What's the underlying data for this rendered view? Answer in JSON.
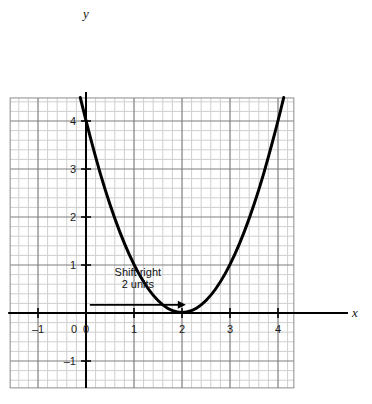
{
  "chart_data": {
    "type": "line",
    "title": "",
    "subtitle": "",
    "xlabel": "x",
    "ylabel": "y",
    "xlim": [
      -1.58,
      4.33
    ],
    "ylim": [
      -1.56,
      4.48
    ],
    "grid": true,
    "minor_grid": true,
    "minor_step": 0.2,
    "major_step": 1,
    "legend": "none",
    "xticks": [
      -1,
      0,
      1,
      2,
      3,
      4
    ],
    "xtick_labels": [
      "–1",
      "0",
      "1",
      "2",
      "3",
      "4"
    ],
    "yticks": [
      -1,
      1,
      2,
      3,
      4
    ],
    "ytick_labels": [
      "–1",
      "1",
      "2",
      "3",
      "4"
    ],
    "origin_label": "0",
    "series": [
      {
        "name": "y = (x - 2)^2",
        "equation": "y = (x – 2)²",
        "vertex": [
          2,
          0
        ],
        "color": "#000000",
        "width": 3,
        "points": [
          [
            -0.12,
            4.49
          ],
          [
            0.0,
            4.0
          ],
          [
            0.2,
            3.24
          ],
          [
            0.4,
            2.56
          ],
          [
            0.6,
            1.96
          ],
          [
            0.8,
            1.44
          ],
          [
            1.0,
            1.0
          ],
          [
            1.2,
            0.64
          ],
          [
            1.4,
            0.36
          ],
          [
            1.6,
            0.16
          ],
          [
            1.8,
            0.04
          ],
          [
            2.0,
            0.0
          ],
          [
            2.2,
            0.04
          ],
          [
            2.4,
            0.16
          ],
          [
            2.6,
            0.36
          ],
          [
            2.8,
            0.64
          ],
          [
            3.0,
            1.0
          ],
          [
            3.2,
            1.44
          ],
          [
            3.4,
            1.96
          ],
          [
            3.6,
            2.56
          ],
          [
            3.8,
            3.24
          ],
          [
            4.0,
            4.0
          ],
          [
            4.12,
            4.49
          ]
        ]
      }
    ],
    "annotations": [
      {
        "name": "shift-right-annotation",
        "line1": "Shift right",
        "line2": "2 units",
        "text_x": 1.08,
        "text_y1": 0.78,
        "text_y2": 0.52,
        "arrow_from": [
          0.08,
          0.17
        ],
        "arrow_to": [
          2.08,
          0.17
        ],
        "arrow_color": "#000000"
      }
    ],
    "colors": {
      "curve": "#000000",
      "axis": "#000000",
      "major_grid": "#7f7f7f",
      "minor_grid": "#cfcfcf",
      "background": "#ffffff",
      "text": "#111111"
    }
  },
  "figure": {
    "axis_x_name": "x",
    "axis_y_name": "y"
  }
}
